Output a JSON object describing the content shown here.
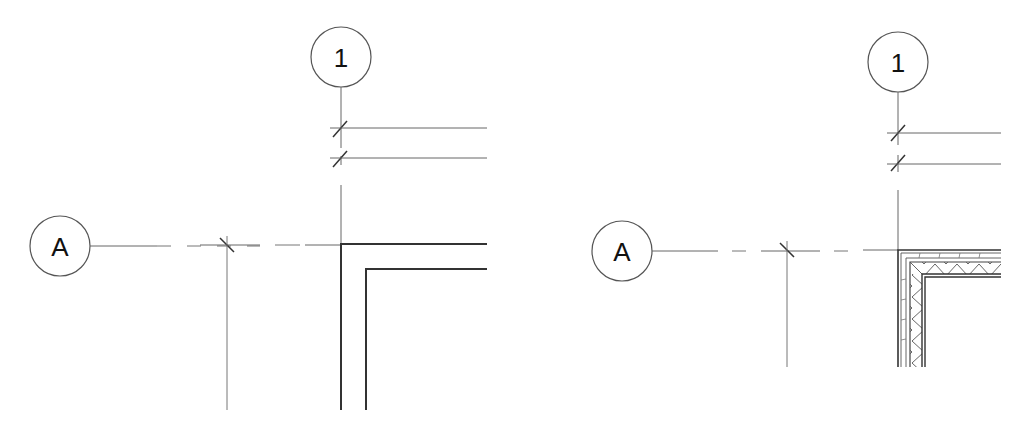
{
  "views": [
    {
      "id": "left",
      "description": "Plan detail - wall corner, coarse (two-line) representation",
      "grid_bubbles": [
        {
          "label": "1",
          "orientation": "vertical"
        },
        {
          "label": "A",
          "orientation": "horizontal"
        }
      ],
      "wall_style": "simple"
    },
    {
      "id": "right",
      "description": "Plan detail - wall corner, fine representation with layered insulation hatch",
      "grid_bubbles": [
        {
          "label": "1",
          "orientation": "vertical"
        },
        {
          "label": "A",
          "orientation": "horizontal"
        }
      ],
      "wall_style": "layered"
    }
  ],
  "colors": {
    "line": "#444444",
    "grid_line": "#666666",
    "background": "#ffffff"
  }
}
